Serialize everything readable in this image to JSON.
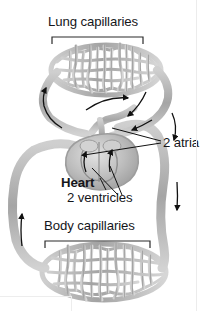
{
  "figure": {
    "kind": "circulatory-system-diagram",
    "background_color": "#ffffff",
    "vessel_color": "#a9a9a9",
    "vessel_color_light": "#c9c9c9",
    "vessel_outline": "#8f8f8f",
    "arrow_color": "#111111",
    "text_color": "#15161a",
    "leader_color": "#111111"
  },
  "labels": {
    "lung_capillaries": "Lung capillaries",
    "body_capillaries": "Body capillaries",
    "heart": "Heart",
    "two_atria": "2 atria",
    "two_ventricles": "2 ventricles"
  },
  "brackets": {
    "lung": {
      "x1": 52,
      "x2": 143,
      "y": 37,
      "tick": 7
    },
    "body": {
      "x1": 45,
      "x2": 150,
      "y": 241,
      "tick": 7
    }
  },
  "capillary_beds": [
    {
      "name": "lung-capillary-bed",
      "cx": 106,
      "cy": 70,
      "rx": 55,
      "ry": 25
    },
    {
      "name": "body-capillary-bed",
      "cx": 104,
      "cy": 272,
      "rx": 62,
      "ry": 28
    }
  ],
  "flow_arrows": [
    {
      "name": "arrow-left-up-to-lung",
      "direction": "up"
    },
    {
      "name": "arrow-top-right-to-lung",
      "direction": "right"
    },
    {
      "name": "arrow-right-down-from-lung",
      "direction": "down"
    },
    {
      "name": "arrow-right-outer-down",
      "direction": "down"
    },
    {
      "name": "arrow-left-outer-up",
      "direction": "up"
    },
    {
      "name": "arrow-ventricle-left-up",
      "direction": "up"
    },
    {
      "name": "arrow-ventricle-right-up",
      "direction": "up"
    }
  ],
  "leader_lines": [
    {
      "name": "leader-2-atria-upper",
      "to": "right atrium"
    },
    {
      "name": "leader-2-atria-lower",
      "to": "left atrium"
    },
    {
      "name": "leader-2-ventricles-left",
      "to": "left ventricle"
    },
    {
      "name": "leader-2-ventricles-right",
      "to": "right ventricle"
    }
  ]
}
